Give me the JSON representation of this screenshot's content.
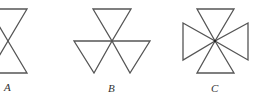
{
  "figures": [
    {
      "id": "A",
      "label": "A",
      "description": "Two triangles meeting at a vertex (hourglass), partially clipped on left"
    },
    {
      "id": "B",
      "label": "B",
      "description": "Three downward-pointing triangles meeting at a common vertex"
    },
    {
      "id": "C",
      "label": "C",
      "description": "Four triangles meeting at a central point (Maltese cross shape)"
    }
  ],
  "colors": {
    "stroke": "#555555",
    "label": "#333333",
    "background": "#ffffff"
  }
}
